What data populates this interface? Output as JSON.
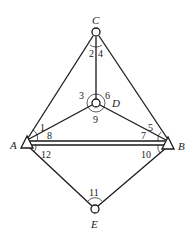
{
  "diagram": {
    "type": "survey-triangulation-network",
    "points": [
      {
        "id": "C",
        "label": "C",
        "symbol": "circle",
        "x": 96,
        "y": 32
      },
      {
        "id": "D",
        "label": "D",
        "symbol": "circle",
        "x": 96,
        "y": 103
      },
      {
        "id": "A",
        "label": "A",
        "symbol": "triangle",
        "x": 27,
        "y": 141
      },
      {
        "id": "B",
        "label": "B",
        "symbol": "triangle",
        "x": 168,
        "y": 142
      },
      {
        "id": "E",
        "label": "E",
        "symbol": "circle",
        "x": 95,
        "y": 209
      }
    ],
    "edges": [
      [
        "C",
        "A"
      ],
      [
        "C",
        "B"
      ],
      [
        "C",
        "D"
      ],
      [
        "D",
        "A"
      ],
      [
        "D",
        "B"
      ],
      [
        "A",
        "B"
      ],
      [
        "A",
        "E"
      ],
      [
        "B",
        "E"
      ]
    ],
    "baseline": {
      "from": "A",
      "to": "B",
      "style": "double-line"
    },
    "angles": [
      "1",
      "2",
      "3",
      "4",
      "5",
      "6",
      "7",
      "8",
      "9",
      "10",
      "11",
      "12"
    ]
  }
}
